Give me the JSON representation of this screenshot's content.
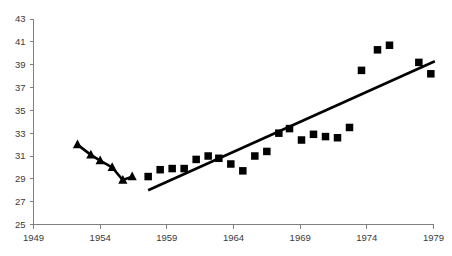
{
  "chart_data": {
    "type": "scatter",
    "title": "",
    "subtitle": "",
    "xlabel": "",
    "ylabel": "",
    "xlim": [
      1949,
      1979
    ],
    "ylim": [
      25,
      43
    ],
    "grid": false,
    "legend": "none",
    "xticks": [
      "1949",
      "1954",
      "1959",
      "1964",
      "1969",
      "1974",
      "1979"
    ],
    "xtick_values": [
      1949,
      1954,
      1959,
      1964,
      1969,
      1974,
      1979
    ],
    "yticks": [
      "25",
      "27",
      "29",
      "31",
      "33",
      "35",
      "37",
      "39",
      "41",
      "43"
    ],
    "ytick_values": [
      25,
      27,
      29,
      31,
      33,
      35,
      37,
      39,
      41,
      43
    ],
    "series": [
      {
        "name": "early-series",
        "marker": "triangle",
        "color": "#000000",
        "connected": true,
        "x": [
          1952.3,
          1953.3,
          1954.0,
          1954.9,
          1955.7,
          1956.4
        ],
        "values": [
          32.0,
          31.1,
          30.6,
          30.0,
          28.9,
          29.2
        ]
      },
      {
        "name": "later-series",
        "marker": "square",
        "color": "#000000",
        "connected": false,
        "x": [
          1957.6,
          1958.5,
          1959.4,
          1960.3,
          1961.2,
          1962.1,
          1962.9,
          1963.8,
          1964.7,
          1965.6,
          1966.5,
          1967.4,
          1968.2,
          1969.1,
          1970.0,
          1970.9,
          1971.8,
          1972.7,
          1973.6,
          1974.8,
          1975.7,
          1977.9,
          1978.8
        ],
        "values": [
          29.2,
          29.8,
          29.9,
          29.9,
          30.7,
          31.0,
          30.8,
          30.3,
          29.7,
          31.0,
          31.4,
          33.0,
          33.4,
          32.4,
          32.9,
          32.7,
          32.6,
          33.5,
          38.5,
          40.3,
          40.7,
          39.2,
          38.2
        ]
      }
    ],
    "trend_line": {
      "name": "linear-trend",
      "color": "#000000",
      "x_start": 1957.6,
      "y_start": 28.0,
      "x_end": 1979.1,
      "y_end": 39.3
    }
  }
}
